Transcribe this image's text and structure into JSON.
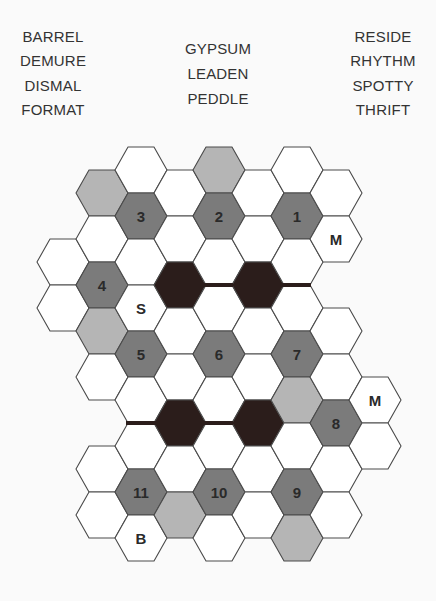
{
  "word_lists": {
    "left": [
      "BARREL",
      "DEMURE",
      "DISMAL",
      "FORMAT"
    ],
    "center": [
      "GYPSUM",
      "LEADEN",
      "PEDDLE"
    ],
    "right": [
      "RESIDE",
      "RHYTHM",
      "SPOTTY",
      "THRIFT"
    ]
  },
  "colors": {
    "background": "#fafafa",
    "white_cell": "#ffffff",
    "light_gray_cell": "#b5b5b5",
    "dark_gray_cell": "#7b7b7b",
    "black_cell": "#2b1d1b",
    "outline": "#4a4a4a",
    "label": "#2a2a2a"
  },
  "board": {
    "hex_width": 52,
    "hex_height": 46,
    "col_step": 39,
    "origin_x": 37,
    "cells": [
      {
        "col": 0,
        "top": 239,
        "fill": "white",
        "label": ""
      },
      {
        "col": 0,
        "top": 285,
        "fill": "white",
        "label": ""
      },
      {
        "col": 1,
        "top": 170,
        "fill": "light",
        "label": ""
      },
      {
        "col": 1,
        "top": 216,
        "fill": "white",
        "label": ""
      },
      {
        "col": 1,
        "top": 262,
        "fill": "dark",
        "label": "4"
      },
      {
        "col": 1,
        "top": 308,
        "fill": "light",
        "label": ""
      },
      {
        "col": 1,
        "top": 354,
        "fill": "white",
        "label": ""
      },
      {
        "col": 1,
        "top": 446,
        "fill": "white",
        "label": ""
      },
      {
        "col": 1,
        "top": 492,
        "fill": "white",
        "label": ""
      },
      {
        "col": 2,
        "top": 147,
        "fill": "white",
        "label": ""
      },
      {
        "col": 2,
        "top": 193,
        "fill": "dark",
        "label": "3"
      },
      {
        "col": 2,
        "top": 239,
        "fill": "white",
        "label": ""
      },
      {
        "col": 2,
        "top": 285,
        "fill": "white",
        "label": "S"
      },
      {
        "col": 2,
        "top": 331,
        "fill": "dark",
        "label": "5"
      },
      {
        "col": 2,
        "top": 377,
        "fill": "white",
        "label": ""
      },
      {
        "col": 2,
        "top": 423,
        "fill": "white",
        "label": ""
      },
      {
        "col": 2,
        "top": 469,
        "fill": "dark",
        "label": "11"
      },
      {
        "col": 2,
        "top": 515,
        "fill": "white",
        "label": "B"
      },
      {
        "col": 3,
        "top": 170,
        "fill": "white",
        "label": ""
      },
      {
        "col": 3,
        "top": 216,
        "fill": "white",
        "label": ""
      },
      {
        "col": 3,
        "top": 262,
        "fill": "black",
        "label": ""
      },
      {
        "col": 3,
        "top": 308,
        "fill": "white",
        "label": ""
      },
      {
        "col": 3,
        "top": 354,
        "fill": "white",
        "label": ""
      },
      {
        "col": 3,
        "top": 400,
        "fill": "black",
        "label": ""
      },
      {
        "col": 3,
        "top": 446,
        "fill": "white",
        "label": ""
      },
      {
        "col": 3,
        "top": 492,
        "fill": "light",
        "label": ""
      },
      {
        "col": 4,
        "top": 147,
        "fill": "light",
        "label": ""
      },
      {
        "col": 4,
        "top": 193,
        "fill": "dark",
        "label": "2"
      },
      {
        "col": 4,
        "top": 239,
        "fill": "white",
        "label": ""
      },
      {
        "col": 4,
        "top": 285,
        "fill": "white",
        "label": ""
      },
      {
        "col": 4,
        "top": 331,
        "fill": "dark",
        "label": "6"
      },
      {
        "col": 4,
        "top": 377,
        "fill": "white",
        "label": ""
      },
      {
        "col": 4,
        "top": 423,
        "fill": "white",
        "label": ""
      },
      {
        "col": 4,
        "top": 469,
        "fill": "dark",
        "label": "10"
      },
      {
        "col": 4,
        "top": 515,
        "fill": "white",
        "label": ""
      },
      {
        "col": 5,
        "top": 170,
        "fill": "white",
        "label": ""
      },
      {
        "col": 5,
        "top": 216,
        "fill": "white",
        "label": ""
      },
      {
        "col": 5,
        "top": 262,
        "fill": "black",
        "label": ""
      },
      {
        "col": 5,
        "top": 308,
        "fill": "white",
        "label": ""
      },
      {
        "col": 5,
        "top": 354,
        "fill": "white",
        "label": ""
      },
      {
        "col": 5,
        "top": 400,
        "fill": "black",
        "label": ""
      },
      {
        "col": 5,
        "top": 446,
        "fill": "white",
        "label": ""
      },
      {
        "col": 5,
        "top": 492,
        "fill": "white",
        "label": ""
      },
      {
        "col": 6,
        "top": 147,
        "fill": "white",
        "label": ""
      },
      {
        "col": 6,
        "top": 193,
        "fill": "dark",
        "label": "1"
      },
      {
        "col": 6,
        "top": 239,
        "fill": "white",
        "label": ""
      },
      {
        "col": 6,
        "top": 285,
        "fill": "white",
        "label": ""
      },
      {
        "col": 6,
        "top": 331,
        "fill": "dark",
        "label": "7"
      },
      {
        "col": 6,
        "top": 377,
        "fill": "light",
        "label": ""
      },
      {
        "col": 6,
        "top": 423,
        "fill": "white",
        "label": ""
      },
      {
        "col": 6,
        "top": 469,
        "fill": "dark",
        "label": "9"
      },
      {
        "col": 6,
        "top": 515,
        "fill": "light",
        "label": ""
      },
      {
        "col": 7,
        "top": 170,
        "fill": "white",
        "label": ""
      },
      {
        "col": 7,
        "top": 216,
        "fill": "white",
        "label": "M"
      },
      {
        "col": 7,
        "top": 308,
        "fill": "white",
        "label": ""
      },
      {
        "col": 7,
        "top": 354,
        "fill": "white",
        "label": ""
      },
      {
        "col": 7,
        "top": 400,
        "fill": "dark",
        "label": "8"
      },
      {
        "col": 7,
        "top": 446,
        "fill": "white",
        "label": ""
      },
      {
        "col": 7,
        "top": 492,
        "fill": "white",
        "label": ""
      },
      {
        "col": 8,
        "top": 377,
        "fill": "white",
        "label": "M"
      },
      {
        "col": 8,
        "top": 423,
        "fill": "white",
        "label": ""
      }
    ],
    "walls": [
      {
        "x1": 204,
        "x2": 233,
        "y": 285
      },
      {
        "x1": 282,
        "x2": 311,
        "y": 285
      },
      {
        "x1": 126,
        "x2": 156,
        "y": 423
      },
      {
        "x1": 204,
        "x2": 233,
        "y": 423
      }
    ]
  }
}
